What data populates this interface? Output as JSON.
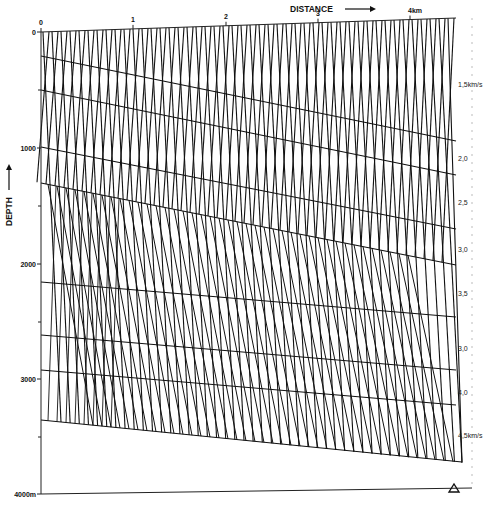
{
  "figure": {
    "title_x": "DISTANCE",
    "title_y": "DEPTH",
    "x_ticks": [
      {
        "label": "0",
        "x": 41
      },
      {
        "label": "1",
        "x": 133
      },
      {
        "label": "2",
        "x": 226
      },
      {
        "label": "3",
        "x": 318
      },
      {
        "label": "4km",
        "x": 410
      }
    ],
    "y_ticks": [
      {
        "label": "0",
        "y": 32
      },
      {
        "label": "1000",
        "y": 148
      },
      {
        "label": "2000",
        "y": 264
      },
      {
        "label": "3000",
        "y": 379
      },
      {
        "label": "4000m",
        "y": 494
      }
    ],
    "velocities": [
      {
        "label": "1,5km/s",
        "y": 87
      },
      {
        "label": "2,0",
        "y": 161
      },
      {
        "label": "2,5",
        "y": 205
      },
      {
        "label": "3,0",
        "y": 252
      },
      {
        "label": "3,5",
        "y": 296
      },
      {
        "label": "3,0",
        "y": 351
      },
      {
        "label": "4,0",
        "y": 395
      },
      {
        "label": "4,5km/s",
        "y": 438
      }
    ],
    "interfaces": [
      {
        "y_left": 56,
        "y_right": 141
      },
      {
        "y_left": 90,
        "y_right": 175
      },
      {
        "y_left": 147,
        "y_right": 229
      },
      {
        "y_left": 183,
        "y_right": 265
      },
      {
        "y_left": 282,
        "y_right": 317
      },
      {
        "y_left": 335,
        "y_right": 370
      },
      {
        "y_left": 370,
        "y_right": 405
      },
      {
        "y_left": 420,
        "y_right": 462
      }
    ],
    "receiver_marker": "triangle-icon",
    "ray_count": 46,
    "colors": {
      "ink": "#111111",
      "paper": "#ffffff",
      "faint": "#9a9a9a"
    }
  }
}
